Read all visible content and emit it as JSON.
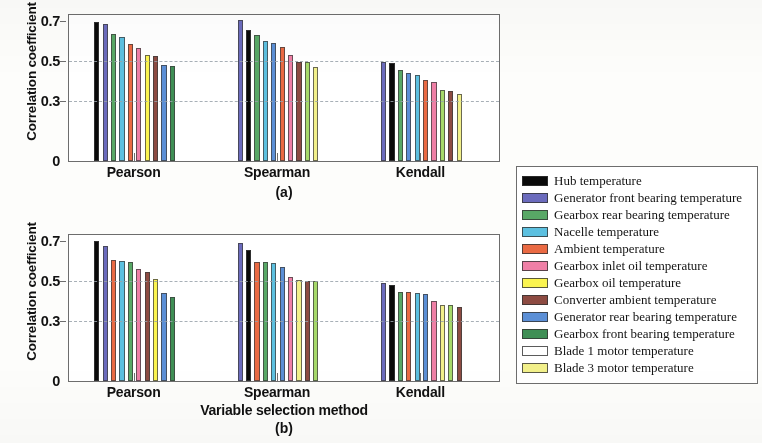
{
  "figure": {
    "ylabel": "Correlation coefficient",
    "xlabel": "Variable selection method",
    "caption_a": "(a)",
    "caption_b": "(b)"
  },
  "legend": {
    "items": [
      {
        "label": "Hub temperature",
        "color": "#0a0a0a"
      },
      {
        "label": "Generator front bearing temperature",
        "color": "#6b6bbd"
      },
      {
        "label": "Gearbox rear bearing temperature",
        "color": "#58a866"
      },
      {
        "label": "Nacelle temperature",
        "color": "#5cc0e0"
      },
      {
        "label": "Ambient temperature",
        "color": "#ea6a43"
      },
      {
        "label": "Gearbox inlet oil temperature",
        "color": "#ef7fa6"
      },
      {
        "label": "Gearbox oil temperature",
        "color": "#fbf44f"
      },
      {
        "label": "Converter ambient temperature",
        "color": "#8d4b42"
      },
      {
        "label": "Generator rear bearing temperature",
        "color": "#5b8fd6"
      },
      {
        "label": "Gearbox front bearing temperature",
        "color": "#3f8f55"
      },
      {
        "label": "Blade 1 motor temperature",
        "color": "#a6d койde"
      },
      {
        "label": "Blade 3 motor temperature",
        "color": "#f2f08a"
      }
    ]
  },
  "chart_data": [
    {
      "id": "a",
      "type": "bar",
      "title": "(a)",
      "xlabel": "",
      "ylabel": "Correlation coefficient",
      "ylim": [
        0,
        0.73
      ],
      "yticks": [
        0,
        0.3,
        0.5,
        0.7
      ],
      "ytick_labels": [
        "0",
        "0.3",
        "0.5",
        "0.7"
      ],
      "gridlines": [
        0.3,
        0.5
      ],
      "grid": true,
      "legend_position": "right-outside",
      "categories": [
        "Pearson",
        "Spearman",
        "Kendall"
      ],
      "groups": [
        {
          "name": "Pearson",
          "bars": [
            {
              "series": "Hub temperature",
              "color": "#0a0a0a",
              "value": 0.695
            },
            {
              "series": "Generator front bearing temperature",
              "color": "#6b6bbd",
              "value": 0.685
            },
            {
              "series": "Gearbox rear bearing temperature",
              "color": "#58a866",
              "value": 0.635
            },
            {
              "series": "Nacelle temperature",
              "color": "#5cc0e0",
              "value": 0.62
            },
            {
              "series": "Ambient temperature",
              "color": "#ea6a43",
              "value": 0.585
            },
            {
              "series": "Gearbox inlet oil temperature",
              "color": "#ef7fa6",
              "value": 0.565
            },
            {
              "series": "Gearbox oil temperature",
              "color": "#fbf44f",
              "value": 0.53
            },
            {
              "series": "Converter ambient temperature",
              "color": "#8d4b42",
              "value": 0.525
            },
            {
              "series": "Generator rear bearing temperature",
              "color": "#5b8fd6",
              "value": 0.48
            },
            {
              "series": "Gearbox front bearing temperature",
              "color": "#3f8f55",
              "value": 0.475
            }
          ]
        },
        {
          "name": "Spearman",
          "bars": [
            {
              "series": "Generator front bearing temperature",
              "color": "#6b6bbd",
              "value": 0.705
            },
            {
              "series": "Hub temperature",
              "color": "#0a0a0a",
              "value": 0.655
            },
            {
              "series": "Gearbox rear bearing temperature",
              "color": "#58a866",
              "value": 0.63
            },
            {
              "series": "Nacelle temperature",
              "color": "#5cc0e0",
              "value": 0.6
            },
            {
              "series": "Generator rear bearing temperature",
              "color": "#5b8fd6",
              "value": 0.59
            },
            {
              "series": "Ambient temperature",
              "color": "#ea6a43",
              "value": 0.57
            },
            {
              "series": "Gearbox inlet oil temperature",
              "color": "#ef7fa6",
              "value": 0.53
            },
            {
              "series": "Converter ambient temperature",
              "color": "#8d4b42",
              "value": 0.495
            },
            {
              "series": "Blade 1 motor temperature",
              "color": "#a6d96a",
              "value": 0.493
            },
            {
              "series": "Blade 3 motor temperature",
              "color": "#f2f08a",
              "value": 0.47
            }
          ]
        },
        {
          "name": "Kendall",
          "bars": [
            {
              "series": "Generator front bearing temperature",
              "color": "#6b6bbd",
              "value": 0.497
            },
            {
              "series": "Hub temperature",
              "color": "#0a0a0a",
              "value": 0.492
            },
            {
              "series": "Gearbox rear bearing temperature",
              "color": "#58a866",
              "value": 0.455
            },
            {
              "series": "Generator rear bearing temperature",
              "color": "#5b8fd6",
              "value": 0.44
            },
            {
              "series": "Nacelle temperature",
              "color": "#5cc0e0",
              "value": 0.432
            },
            {
              "series": "Ambient temperature",
              "color": "#ea6a43",
              "value": 0.405
            },
            {
              "series": "Gearbox inlet oil temperature",
              "color": "#ef7fa6",
              "value": 0.395
            },
            {
              "series": "Blade 1 motor temperature",
              "color": "#a6d96a",
              "value": 0.355
            },
            {
              "series": "Converter ambient temperature",
              "color": "#8d4b42",
              "value": 0.35
            },
            {
              "series": "Blade 3 motor temperature",
              "color": "#f2f08a",
              "value": 0.335
            }
          ]
        }
      ]
    },
    {
      "id": "b",
      "type": "bar",
      "title": "(b)",
      "xlabel": "Variable selection method",
      "ylabel": "Correlation coefficient",
      "ylim": [
        0,
        0.73
      ],
      "yticks": [
        0,
        0.3,
        0.5,
        0.7
      ],
      "ytick_labels": [
        "0",
        "0.3",
        "0.5",
        "0.7"
      ],
      "gridlines": [
        0.3,
        0.5
      ],
      "grid": true,
      "legend_position": "right-outside",
      "categories": [
        "Pearson",
        "Spearman",
        "Kendall"
      ],
      "groups": [
        {
          "name": "Pearson",
          "bars": [
            {
              "series": "Hub temperature",
              "color": "#0a0a0a",
              "value": 0.7
            },
            {
              "series": "Generator front bearing temperature",
              "color": "#6b6bbd",
              "value": 0.675
            },
            {
              "series": "Ambient temperature",
              "color": "#ea6a43",
              "value": 0.605
            },
            {
              "series": "Nacelle temperature",
              "color": "#5cc0e0",
              "value": 0.6
            },
            {
              "series": "Gearbox rear bearing temperature",
              "color": "#58a866",
              "value": 0.595
            },
            {
              "series": "Gearbox inlet oil temperature",
              "color": "#ef7fa6",
              "value": 0.56
            },
            {
              "series": "Converter ambient temperature",
              "color": "#8d4b42",
              "value": 0.545
            },
            {
              "series": "Gearbox oil temperature",
              "color": "#fbf44f",
              "value": 0.51
            },
            {
              "series": "Generator rear bearing temperature",
              "color": "#5b8fd6",
              "value": 0.44
            },
            {
              "series": "Gearbox front bearing temperature",
              "color": "#3f8f55",
              "value": 0.42
            }
          ]
        },
        {
          "name": "Spearman",
          "bars": [
            {
              "series": "Generator front bearing temperature",
              "color": "#6b6bbd",
              "value": 0.69
            },
            {
              "series": "Hub temperature",
              "color": "#0a0a0a",
              "value": 0.655
            },
            {
              "series": "Ambient temperature",
              "color": "#ea6a43",
              "value": 0.595
            },
            {
              "series": "Gearbox rear bearing temperature",
              "color": "#58a866",
              "value": 0.593
            },
            {
              "series": "Nacelle temperature",
              "color": "#5cc0e0",
              "value": 0.59
            },
            {
              "series": "Generator rear bearing temperature",
              "color": "#5b8fd6",
              "value": 0.57
            },
            {
              "series": "Gearbox inlet oil temperature",
              "color": "#ef7fa6",
              "value": 0.52
            },
            {
              "series": "Blade 3 motor temperature",
              "color": "#f2f08a",
              "value": 0.505
            },
            {
              "series": "Converter ambient temperature",
              "color": "#8d4b42",
              "value": 0.5
            },
            {
              "series": "Blade 1 motor temperature",
              "color": "#a6d96a",
              "value": 0.5
            }
          ]
        },
        {
          "name": "Kendall",
          "bars": [
            {
              "series": "Generator front bearing temperature",
              "color": "#6b6bbd",
              "value": 0.49
            },
            {
              "series": "Hub temperature",
              "color": "#0a0a0a",
              "value": 0.48
            },
            {
              "series": "Gearbox rear bearing temperature",
              "color": "#58a866",
              "value": 0.445
            },
            {
              "series": "Ambient temperature",
              "color": "#ea6a43",
              "value": 0.443
            },
            {
              "series": "Nacelle temperature",
              "color": "#5cc0e0",
              "value": 0.44
            },
            {
              "series": "Generator rear bearing temperature",
              "color": "#5b8fd6",
              "value": 0.435
            },
            {
              "series": "Gearbox inlet oil temperature",
              "color": "#ef7fa6",
              "value": 0.4
            },
            {
              "series": "Blade 3 motor temperature",
              "color": "#f2f08a",
              "value": 0.382
            },
            {
              "series": "Blade 1 motor temperature",
              "color": "#a6d96a",
              "value": 0.38
            },
            {
              "series": "Converter ambient temperature",
              "color": "#8d4b42",
              "value": 0.37
            }
          ]
        }
      ]
    }
  ]
}
